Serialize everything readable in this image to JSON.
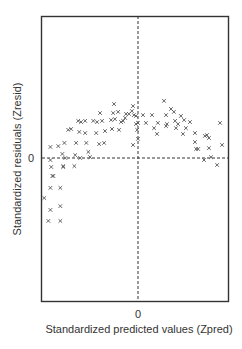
{
  "chart_data": {
    "type": "scatter",
    "title": "",
    "xlabel": "Standardized predicted values (Zpred)",
    "ylabel": "Standardized residuals (Zresid)",
    "x_ticks": [
      {
        "value": 0,
        "label": "0"
      }
    ],
    "y_ticks": [
      {
        "value": 0,
        "label": "0"
      }
    ],
    "xlim": [
      -3.2,
      3.2
    ],
    "ylim": [
      -5.0,
      5.0
    ],
    "grid": false,
    "reference_lines": [
      {
        "orientation": "vertical",
        "value": 0,
        "style": "dashed"
      },
      {
        "orientation": "horizontal",
        "value": 0,
        "style": "dashed"
      }
    ],
    "marker": "x",
    "legend": null,
    "series": [
      {
        "name": "residuals",
        "points": [
          [
            -3.21,
            -1.38
          ],
          [
            -3.07,
            -2.17
          ],
          [
            -3.0,
            -1.79
          ],
          [
            -3.0,
            -1.03
          ],
          [
            -2.93,
            -0.62
          ],
          [
            -2.97,
            -0.31
          ],
          [
            -3.0,
            -0.07
          ],
          [
            -3.0,
            0.38
          ],
          [
            -2.9,
            -0.62
          ],
          [
            -2.66,
            -1.03
          ],
          [
            -2.66,
            -1.66
          ],
          [
            -2.66,
            -2.17
          ],
          [
            -2.73,
            0.41
          ],
          [
            -2.59,
            0.14
          ],
          [
            -2.56,
            -0.28
          ],
          [
            -2.52,
            0.52
          ],
          [
            -2.49,
            0.0
          ],
          [
            -2.56,
            -0.31
          ],
          [
            -2.39,
            0.97
          ],
          [
            -2.29,
            1.0
          ],
          [
            -2.18,
            -0.28
          ],
          [
            -2.15,
            0.1
          ],
          [
            -2.12,
            0.52
          ],
          [
            -2.05,
            1.28
          ],
          [
            -2.01,
            0.9
          ],
          [
            -1.98,
            0.0
          ],
          [
            -1.95,
            1.24
          ],
          [
            -1.81,
            1.28
          ],
          [
            -1.81,
            0.86
          ],
          [
            -1.77,
            0.52
          ],
          [
            -1.7,
            0.21
          ],
          [
            -1.64,
            0.03
          ],
          [
            -1.53,
            1.28
          ],
          [
            -1.43,
            0.86
          ],
          [
            -1.4,
            1.24
          ],
          [
            -1.33,
            0.48
          ],
          [
            -1.3,
            1.55
          ],
          [
            -1.23,
            1.28
          ],
          [
            -1.16,
            0.52
          ],
          [
            -1.13,
            0.93
          ],
          [
            -0.92,
            1.31
          ],
          [
            -0.89,
            1.0
          ],
          [
            -0.85,
            1.55
          ],
          [
            -0.82,
            1.86
          ],
          [
            -0.79,
            1.34
          ],
          [
            -0.68,
            1.59
          ],
          [
            -0.65,
            0.97
          ],
          [
            -0.58,
            1.24
          ],
          [
            -0.51,
            1.28
          ],
          [
            -0.44,
            1.38
          ],
          [
            -0.41,
            1.52
          ],
          [
            -0.31,
            1.52
          ],
          [
            -0.21,
            1.62
          ],
          [
            -0.17,
            0.45
          ],
          [
            -0.17,
            1.79
          ],
          [
            -0.14,
            1.48
          ],
          [
            -0.07,
            1.17
          ],
          [
            -0.03,
            0.97
          ],
          [
            -0.07,
            1.45
          ],
          [
            0.0,
            0.66
          ],
          [
            0.0,
            1.21
          ],
          [
            0.17,
            1.48
          ],
          [
            0.27,
            1.21
          ],
          [
            0.48,
            1.48
          ],
          [
            0.55,
            1.03
          ],
          [
            0.65,
            0.83
          ],
          [
            0.68,
            1.21
          ],
          [
            0.89,
            1.97
          ],
          [
            0.96,
            1.48
          ],
          [
            0.96,
            1.1
          ],
          [
            0.99,
            1.17
          ],
          [
            1.13,
            1.69
          ],
          [
            1.23,
            1.59
          ],
          [
            1.27,
            1.28
          ],
          [
            1.3,
            1.03
          ],
          [
            1.37,
            1.17
          ],
          [
            1.47,
            1.45
          ],
          [
            1.54,
            0.83
          ],
          [
            1.58,
            1.31
          ],
          [
            1.64,
            1.03
          ],
          [
            1.78,
            1.24
          ],
          [
            1.95,
            0.86
          ],
          [
            1.95,
            0.55
          ],
          [
            1.99,
            0.31
          ],
          [
            2.06,
            0.31
          ],
          [
            2.26,
            -0.07
          ],
          [
            2.29,
            0.76
          ],
          [
            2.36,
            0.79
          ],
          [
            2.43,
            0.69
          ],
          [
            2.43,
            0.34
          ],
          [
            2.5,
            0.03
          ],
          [
            2.71,
            -0.24
          ],
          [
            2.81,
            1.21
          ],
          [
            2.88,
            0.45
          ]
        ]
      }
    ]
  },
  "layout": {
    "frame": {
      "left": 41,
      "top": 16,
      "right": 229,
      "bottom": 302
    },
    "origin_px": {
      "x": 138,
      "y": 158
    },
    "px_per_unit": {
      "x": 29.2,
      "y": 29.0
    }
  }
}
